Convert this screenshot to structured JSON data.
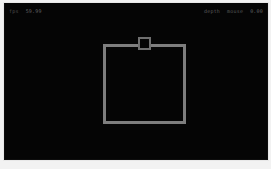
{
  "viewport": {
    "background_color": "#050505",
    "frame_color": "#e8e8e8"
  },
  "hud": {
    "left": {
      "label": "fps",
      "value": "59.99"
    },
    "right": {
      "label_one": "depth",
      "label_two": "mouse",
      "value": "0.00"
    },
    "text_color": "#5a5a5a"
  },
  "scene": {
    "selection_rect": {
      "name": "selection-rectangle",
      "stroke_color": "#7e7e7e",
      "stroke_width": 3,
      "x": 99,
      "y": 41,
      "width": 83,
      "height": 80
    },
    "top_handle": {
      "name": "top-edge-handle",
      "stroke_color": "#6f6f6f",
      "fill_color": "#050505",
      "x": 134,
      "y": 34,
      "width": 13,
      "height": 13
    }
  }
}
